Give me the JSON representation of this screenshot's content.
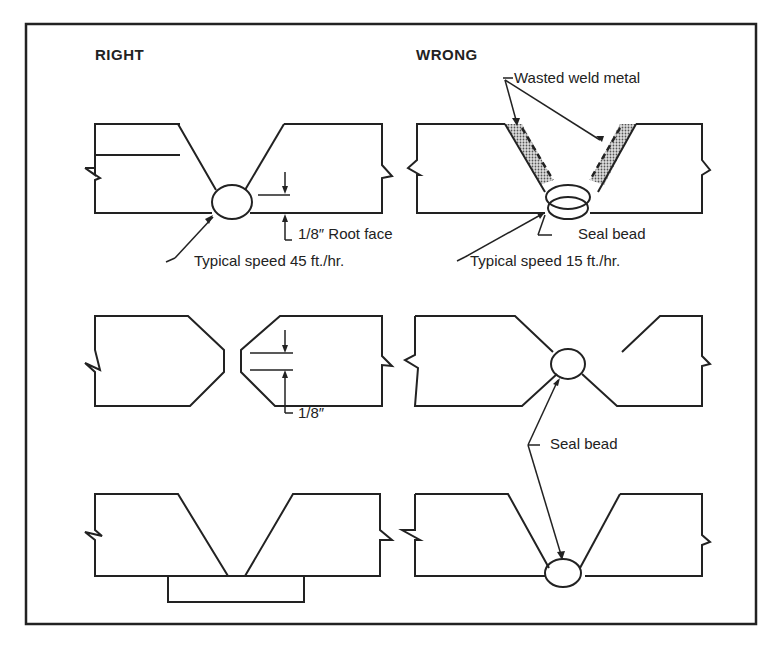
{
  "figure": {
    "headers": {
      "right": "RIGHT",
      "wrong": "WRONG"
    },
    "labels": {
      "root_face": "1/8″ Root face",
      "typical_speed_right": "Typical speed 45 ft./hr.",
      "wasted_weld_metal": "Wasted weld metal",
      "seal_bead_top": "Seal bead",
      "typical_speed_wrong": "Typical speed 15 ft./hr.",
      "gap": "1/8″",
      "seal_bead_mid": "Seal bead"
    },
    "colors": {
      "line": "#222222",
      "background": "#ffffff",
      "hatch": "#8a8a8a"
    }
  }
}
